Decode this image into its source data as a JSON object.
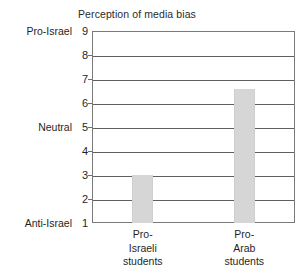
{
  "chart_data": {
    "type": "bar",
    "title": "Perception of media bias",
    "xlabel": "",
    "ylabel": "",
    "categories": [
      "Pro-Israeli students",
      "Pro-Arab students"
    ],
    "category_lines": [
      [
        "Pro-",
        "Israeli",
        "students"
      ],
      [
        "Pro-",
        "Arab",
        "students"
      ]
    ],
    "values": [
      3.0,
      6.6
    ],
    "ylim": [
      1,
      9
    ],
    "yticks": [
      9,
      8,
      7,
      6,
      5,
      4,
      3,
      2,
      1
    ],
    "ytick_labels": [
      "9",
      "8",
      "7",
      "6",
      "5",
      "4",
      "3",
      "2",
      "1"
    ],
    "y_anchor_labels": [
      {
        "value": 9,
        "label": "Pro-Israel"
      },
      {
        "value": 5,
        "label": "Neutral"
      },
      {
        "value": 1,
        "label": "Anti-Israel"
      }
    ],
    "grid": true,
    "legend": false,
    "bar_color": "#d6d6d6",
    "axis_color": "#5f5f5f",
    "frame_color": "#7a7a7a",
    "background": "#ffffff"
  }
}
